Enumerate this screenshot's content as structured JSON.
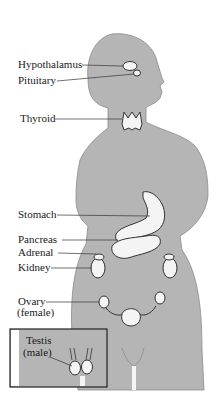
{
  "figure": {
    "type": "endocrine-glands-diagram",
    "colors": {
      "body_fill": "#b5b5b5",
      "body_outline": "#8a8a8a",
      "organ_fill": "#f4f4f4",
      "line": "#333333",
      "inset_border": "#222222"
    },
    "labels": {
      "hypothalamus": "Hypothalamus",
      "pituitary": "Pituitary",
      "thyroid": "Thyroid",
      "stomach": "Stomach",
      "pancreas": "Pancreas",
      "adrenal": "Adrenal",
      "kidney": "Kidney",
      "ovary": "Ovary",
      "ovary_note": "(female)",
      "testis": "Testis",
      "testis_note": "(male)"
    },
    "caption": ""
  }
}
